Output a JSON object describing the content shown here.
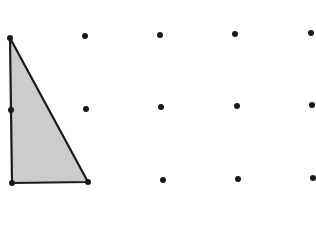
{
  "diagram": {
    "type": "dot-grid-with-triangle",
    "colors": {
      "background": "#ffffff",
      "dot": "#1a1a1a",
      "stroke": "#1a1a1a",
      "fill": "#cccccc"
    },
    "grid": {
      "rows": 3,
      "cols": 5,
      "dots": [
        {
          "x": 10,
          "y": 38
        },
        {
          "x": 85,
          "y": 36
        },
        {
          "x": 160,
          "y": 35
        },
        {
          "x": 235,
          "y": 34
        },
        {
          "x": 311,
          "y": 33
        },
        {
          "x": 11,
          "y": 110
        },
        {
          "x": 86,
          "y": 109
        },
        {
          "x": 161,
          "y": 107
        },
        {
          "x": 237,
          "y": 106
        },
        {
          "x": 312,
          "y": 105
        },
        {
          "x": 12,
          "y": 183
        },
        {
          "x": 88,
          "y": 182
        },
        {
          "x": 163,
          "y": 180
        },
        {
          "x": 238,
          "y": 179
        },
        {
          "x": 313,
          "y": 178
        }
      ]
    },
    "triangle": {
      "vertices": [
        {
          "x": 10,
          "y": 38
        },
        {
          "x": 12,
          "y": 183
        },
        {
          "x": 88,
          "y": 182
        }
      ],
      "description": "Right triangle shaded gray, legs along left column and bottom row"
    }
  }
}
